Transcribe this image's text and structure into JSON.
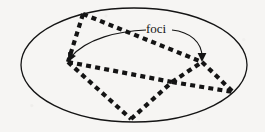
{
  "figure": {
    "background_color": "#f6f5f3",
    "stroke_color": "#141414",
    "annotations": {
      "foci_label": "foci"
    }
  },
  "chart_data": {
    "type": "diagram",
    "title": "foci",
    "xlabel": "",
    "ylabel": "",
    "grid": false,
    "legend": null,
    "ellipse": {
      "cx": 134,
      "cy": 65,
      "rx": 113,
      "ry": 57,
      "stroke_width": 1.3,
      "fill": "none"
    },
    "foci_points": [
      {
        "name": "left-focus",
        "x": 68,
        "y": 62
      },
      {
        "name": "right-focus",
        "x": 202,
        "y": 62
      }
    ],
    "vertices": [
      {
        "name": "top",
        "x": 83,
        "y": 14
      },
      {
        "name": "left",
        "x": 68,
        "y": 62
      },
      {
        "name": "mid-junction",
        "x": 172,
        "y": 82
      },
      {
        "name": "right-upper",
        "x": 202,
        "y": 62
      },
      {
        "name": "right-edge",
        "x": 233,
        "y": 92
      },
      {
        "name": "bottom",
        "x": 131,
        "y": 119
      }
    ],
    "dashed_paths": [
      {
        "name": "top-to-right-upper",
        "points": [
          [
            83,
            14
          ],
          [
            202,
            62
          ]
        ]
      },
      {
        "name": "top-to-left",
        "points": [
          [
            83,
            14
          ],
          [
            68,
            62
          ]
        ]
      },
      {
        "name": "left-to-mid-junction",
        "points": [
          [
            68,
            62
          ],
          [
            172,
            82
          ]
        ]
      },
      {
        "name": "mid-junction-to-right-upper",
        "points": [
          [
            172,
            82
          ],
          [
            202,
            62
          ]
        ]
      },
      {
        "name": "mid-junction-to-right-edge",
        "points": [
          [
            172,
            82
          ],
          [
            233,
            92
          ]
        ]
      },
      {
        "name": "right-upper-to-right-edge",
        "points": [
          [
            202,
            62
          ],
          [
            233,
            92
          ]
        ]
      },
      {
        "name": "left-to-bottom",
        "points": [
          [
            68,
            62
          ],
          [
            131,
            119
          ]
        ]
      },
      {
        "name": "bottom-to-mid-junction",
        "points": [
          [
            131,
            119
          ],
          [
            172,
            82
          ]
        ]
      }
    ],
    "dash_style": {
      "stroke_width": 4.2,
      "dash": 5,
      "gap": 4.2
    },
    "arrows": [
      {
        "name": "left-arrow",
        "path": "M 146 30 C 120 31 86 38 70 58",
        "tip": [
          68,
          62
        ],
        "stroke_width": 1.1
      },
      {
        "name": "right-arrow",
        "path": "M 172 30 C 190 32 202 42 202 57",
        "tip": [
          202,
          62
        ],
        "stroke_width": 1.1
      }
    ],
    "text_labels": [
      {
        "name": "foci",
        "text": "foci",
        "x": 146,
        "y": 33,
        "font_size": 13
      }
    ]
  }
}
